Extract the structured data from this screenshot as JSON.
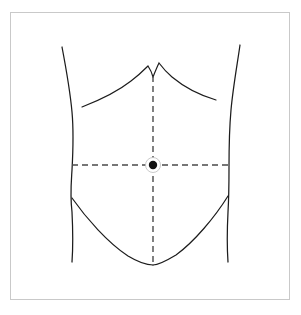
{
  "figure": {
    "title": "Anterior abdominal wall surface anatomy diagram",
    "background_color": "#ffffff",
    "frame_color": "#c9c9c9",
    "line_color": "#1c1c1c",
    "dash_color": "#4a4a4a",
    "umbilicus_color": "#111111"
  },
  "landmarks": {
    "umbilicus": {
      "name": "umbilicus",
      "label": "Umbilicus (navel)",
      "x": 153,
      "y": 165,
      "dot_radius": 4.2,
      "halo_radius": 7.5
    },
    "xiphoid_notch": {
      "name": "xiphoid-notch",
      "label": "Xiphoid notch",
      "x": 153,
      "y": 76
    },
    "pubic_point": {
      "name": "pubic-point",
      "label": "Pubic symphysis",
      "x": 153,
      "y": 265
    }
  },
  "planes": {
    "median": {
      "name": "median-plane",
      "label": "Median (vertical) plane",
      "x1": 153,
      "y1": 76,
      "x2": 153,
      "y2": 265,
      "style": "dashed"
    },
    "transumbilical": {
      "name": "transumbilical-plane",
      "label": "Transumbilical (horizontal) plane",
      "x1": 72,
      "y1": 165,
      "x2": 229,
      "y2": 165,
      "style": "dashed"
    }
  },
  "contours": {
    "left_flank": {
      "name": "left-flank-contour",
      "label": "Left lateral torso contour",
      "path": "M 62,47 C 66,68 70,90 72,112 C 74,134 73,152 72,170 C 71,186 70,196 72,212 C 73,232 73,248 72,262"
    },
    "right_flank": {
      "name": "right-flank-contour",
      "label": "Right lateral torso contour",
      "path": "M 240,45 C 237,66 233,88 231,110 C 229,132 229,150 229,168 C 229,184 229,196 228,212 C 227,232 227,248 228,262"
    },
    "costal_margin_left": {
      "name": "costal-margin-left",
      "label": "Left costal margin",
      "path": "M 82,107 C 100,100 117,92 131,81 C 139,75 144,70 148,66 C 150,69 152,73 153,77"
    },
    "costal_margin_right": {
      "name": "costal-margin-right",
      "label": "Right costal margin",
      "path": "M 216,100 C 199,95 184,87 172,77 C 166,72 162,67 159,63 C 157,67 155,72 153,77"
    },
    "inguinal_left": {
      "name": "inguinal-line-left",
      "label": "Left inguinal (groin) line",
      "path": "M 72,198 C 86,218 108,243 128,256 C 138,262 147,265 153,265"
    },
    "inguinal_right": {
      "name": "inguinal-line-right",
      "label": "Right inguinal (groin) line",
      "path": "M 228,196 C 215,217 194,242 176,255 C 166,261 158,265 153,265"
    }
  },
  "quadrants": [
    {
      "name": "right-upper-quadrant",
      "label": "Right upper quadrant"
    },
    {
      "name": "left-upper-quadrant",
      "label": "Left upper quadrant"
    },
    {
      "name": "right-lower-quadrant",
      "label": "Right lower quadrant"
    },
    {
      "name": "left-lower-quadrant",
      "label": "Left lower quadrant"
    }
  ]
}
